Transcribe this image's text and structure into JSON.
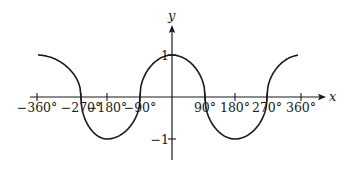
{
  "chart_data": {
    "type": "line",
    "title": "",
    "xlabel": "x",
    "ylabel": "y",
    "x_ticks": [
      -360,
      -270,
      -180,
      -90,
      90,
      180,
      270,
      360
    ],
    "x_tick_labels": [
      "−360°",
      "−270°",
      "−180°",
      "−90°",
      "90°",
      "180°",
      "270°",
      "360°"
    ],
    "y_ticks": [
      1,
      -1
    ],
    "y_tick_labels": [
      "1",
      "−1"
    ],
    "xlim": [
      -360,
      360
    ],
    "ylim": [
      -1,
      1
    ],
    "grid": false,
    "legend": null,
    "series": [
      {
        "name": "curve",
        "description": "periodic cosine-like wave, flattened at peaks and troughs",
        "x": [
          -360,
          -315,
          -270,
          -225,
          -180,
          -135,
          -90,
          -45,
          0,
          45,
          90,
          135,
          180,
          225,
          270,
          315,
          360
        ],
        "y": [
          1,
          0.89,
          0,
          -0.89,
          -1,
          -0.89,
          0,
          0.89,
          1,
          0.89,
          0,
          -0.89,
          -1,
          -0.89,
          0,
          0.89,
          1
        ]
      }
    ],
    "colors": {
      "line": "#1a1a1a",
      "axis": "#1a1a1a",
      "background": "#ffffff"
    }
  }
}
